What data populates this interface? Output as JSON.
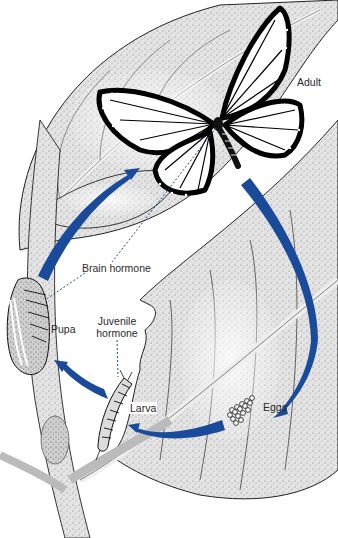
{
  "diagram": {
    "stages": [
      {
        "id": "adult",
        "label": "Adult"
      },
      {
        "id": "eggs",
        "label": "Eggs"
      },
      {
        "id": "larva",
        "label": "Larva"
      },
      {
        "id": "pupa",
        "label": "Pupa"
      }
    ],
    "hormones": [
      {
        "id": "brain",
        "label": "Brain hormone"
      },
      {
        "id": "juvenile",
        "line1": "Juvenile",
        "line2": "hormone"
      }
    ],
    "colors": {
      "arrow": "#1a4a9a",
      "ink": "#1a1a1a",
      "leaf_shade": "#d6d6d6",
      "background": "#ffffff"
    }
  }
}
